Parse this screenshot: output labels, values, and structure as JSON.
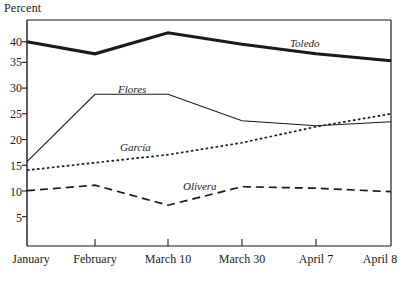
{
  "chart_data": {
    "type": "line",
    "title": "",
    "ylabel": "Percent",
    "xlabel": "",
    "categories": [
      "January",
      "February",
      "March 10",
      "March 30",
      "April 7",
      "April 8"
    ],
    "ylim": [
      0,
      45
    ],
    "yticks": [
      5,
      10,
      15,
      20,
      25,
      30,
      35,
      40
    ],
    "grid": false,
    "legend_position": "inline-labels",
    "series": [
      {
        "name": "Toledo",
        "style": "solid-thick",
        "values": [
          40.0,
          37.6,
          41.8,
          39.5,
          37.6,
          36.2
        ],
        "label_x_category": "March 30",
        "label_value": 40.5
      },
      {
        "name": "Flores",
        "style": "solid-thin",
        "values": [
          16.0,
          29.5,
          29.5,
          24.2,
          23.2,
          24.0
        ],
        "label_x_category": "February",
        "label_value": 31.0
      },
      {
        "name": "García",
        "style": "dotted",
        "values": [
          14.3,
          15.8,
          17.4,
          19.8,
          23.0,
          25.6
        ],
        "label_x_category": "February",
        "label_value": 19.7
      },
      {
        "name": "Olivera",
        "style": "dashed",
        "values": [
          10.2,
          11.3,
          7.3,
          11.0,
          10.7,
          10.0
        ],
        "label_x_category": "March 10",
        "label_value": 12.8
      }
    ]
  },
  "axis": {
    "y_title": "Percent",
    "y_tick_labels": [
      "40",
      "35",
      "30",
      "25",
      "20",
      "15",
      "10",
      "5"
    ],
    "x_tick_labels": [
      "January",
      "February",
      "March 10",
      "March 30",
      "April 7",
      "April 8"
    ]
  },
  "series_labels": {
    "toledo": "Toledo",
    "flores": "Flores",
    "garcia": "García",
    "olivera": "Olivera"
  },
  "colors": {
    "ink": "#1a1a1a",
    "background": "#ffffff"
  }
}
